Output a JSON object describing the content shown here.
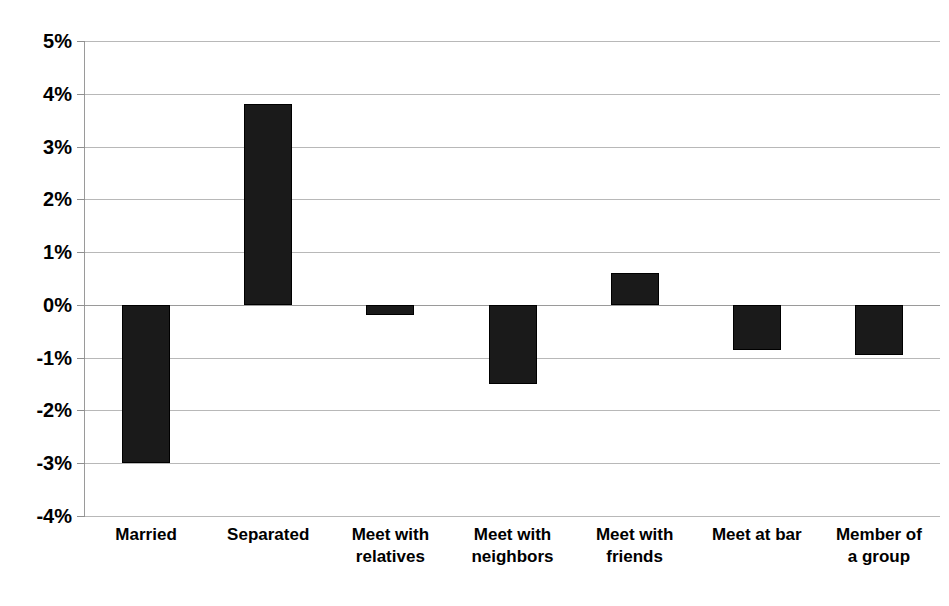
{
  "chart_data": {
    "type": "bar",
    "title": "",
    "subtitle": "",
    "xlabel": "",
    "ylabel": "",
    "categories": [
      "Married",
      "Separated",
      "Meet with\nrelatives",
      "Meet with\nneighbors",
      "Meet with\nfriends",
      "Meet at bar",
      "Member of\na group"
    ],
    "values": [
      -3.0,
      3.8,
      -0.2,
      -1.5,
      0.6,
      -0.85,
      -0.95
    ],
    "value_labels": [
      "-3.0%",
      "3.8%",
      "-0.2%",
      "-1.5%",
      "0.6%",
      "-0.85%",
      "-0.95%"
    ],
    "ylim": [
      -4,
      5
    ],
    "ytick_values": [
      5,
      4,
      3,
      2,
      1,
      0,
      -1,
      -2,
      -3,
      -4
    ],
    "ytick_labels": [
      "5%",
      "4%",
      "3%",
      "2%",
      "1%",
      "0%",
      "-1%",
      "-2%",
      "-3%",
      "-4%"
    ],
    "grid": true,
    "legend": false,
    "legend_position": "none",
    "bar_color": "#1a1a1a",
    "gridline_color": "#b8b8b8",
    "axis_color": "#9a9a9a",
    "background_color": "#ffffff"
  }
}
